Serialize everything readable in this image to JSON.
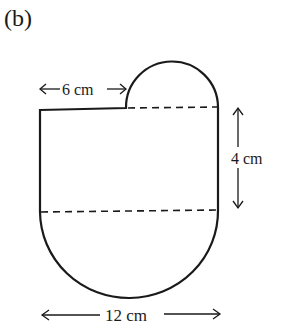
{
  "figure": {
    "label": "(b)",
    "dimensions": {
      "small_semicircle_offset": "6 cm",
      "rectangle_height": "4 cm",
      "total_width": "12 cm"
    },
    "line_color": "#1a1a1a"
  }
}
